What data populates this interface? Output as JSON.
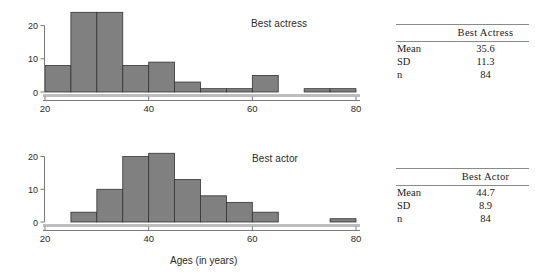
{
  "chart_data": [
    {
      "type": "bar",
      "name": "best-actress-histogram",
      "title": "Best actress",
      "xlabel": "",
      "ylabel": "",
      "bin_width": 5,
      "bin_starts": [
        20,
        25,
        30,
        35,
        40,
        45,
        50,
        55,
        60,
        65,
        70,
        75
      ],
      "categories": [
        "20-25",
        "25-30",
        "30-35",
        "35-40",
        "40-45",
        "45-50",
        "50-55",
        "55-60",
        "60-65",
        "65-70",
        "70-75",
        "75-80"
      ],
      "values": [
        8,
        24,
        24,
        8,
        9,
        3,
        1,
        1,
        5,
        0,
        1,
        1
      ],
      "xlim": [
        20,
        80
      ],
      "ylim": [
        0,
        25
      ],
      "xticks": [
        20,
        40,
        60,
        80
      ],
      "yticks": [
        0,
        10,
        20
      ],
      "grid": false,
      "bar_color": "#808080",
      "bar_edge_color": "#333333"
    },
    {
      "type": "bar",
      "name": "best-actor-histogram",
      "title": "Best actor",
      "xlabel": "Ages (in years)",
      "ylabel": "",
      "bin_width": 5,
      "bin_starts": [
        20,
        25,
        30,
        35,
        40,
        45,
        50,
        55,
        60,
        65,
        70,
        75
      ],
      "categories": [
        "20-25",
        "25-30",
        "30-35",
        "35-40",
        "40-45",
        "45-50",
        "50-55",
        "55-60",
        "60-65",
        "65-70",
        "70-75",
        "75-80"
      ],
      "values": [
        0,
        3,
        10,
        20,
        21,
        13,
        8,
        6,
        3,
        0,
        0,
        1
      ],
      "xlim": [
        20,
        80
      ],
      "ylim": [
        0,
        22
      ],
      "xticks": [
        20,
        40,
        60,
        80
      ],
      "yticks": [
        0,
        10,
        20
      ],
      "grid": false,
      "bar_color": "#808080",
      "bar_edge_color": "#333333"
    }
  ],
  "charts": {
    "actress": {
      "title": "Best actress",
      "xticklabels": [
        "20",
        "40",
        "60",
        "80"
      ],
      "yticklabels": [
        "0",
        "10",
        "20"
      ]
    },
    "actor": {
      "title": "Best actor",
      "axis_title": "Ages (in years)",
      "xticklabels": [
        "20",
        "40",
        "60",
        "80"
      ],
      "yticklabels": [
        "0",
        "10",
        "20"
      ]
    }
  },
  "tables": {
    "actress": {
      "header_blank": "",
      "header": "Best  Actress",
      "rows": [
        {
          "label": "Mean",
          "value": "35.6"
        },
        {
          "label": "SD",
          "value": "11.3"
        },
        {
          "label": "n",
          "value": "84"
        }
      ]
    },
    "actor": {
      "header_blank": "",
      "header": "Best  Actor",
      "rows": [
        {
          "label": "Mean",
          "value": "44.7"
        },
        {
          "label": "SD",
          "value": "8.9"
        },
        {
          "label": "n",
          "value": "84"
        }
      ]
    }
  }
}
